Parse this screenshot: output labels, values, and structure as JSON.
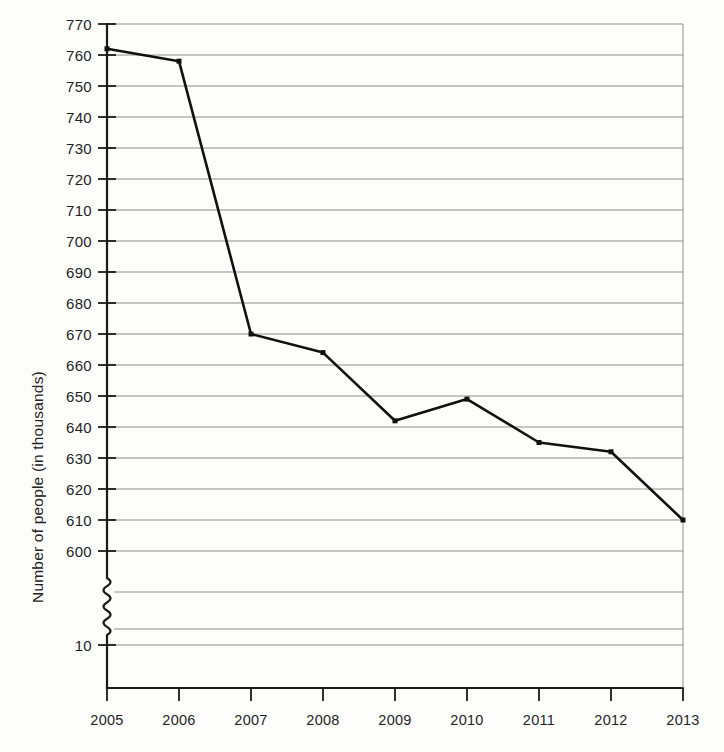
{
  "chart_data": {
    "type": "line",
    "title": "",
    "subtitle": "",
    "xlabel": "",
    "ylabel": "Number of people (in thousands)",
    "categories": [
      "2005",
      "2006",
      "2007",
      "2008",
      "2009",
      "2010",
      "2011",
      "2012",
      "2013"
    ],
    "x": [
      2005,
      2006,
      2007,
      2008,
      2009,
      2010,
      2011,
      2012,
      2013
    ],
    "values": [
      762,
      758,
      670,
      664,
      642,
      649,
      635,
      632,
      610
    ],
    "series": [
      {
        "name": "Number of people",
        "values": [
          762,
          758,
          670,
          664,
          642,
          649,
          635,
          632,
          610
        ]
      }
    ],
    "ylim": [
      600,
      770
    ],
    "ytick_labels": [
      "770",
      "760",
      "750",
      "740",
      "730",
      "720",
      "710",
      "700",
      "690",
      "680",
      "670",
      "660",
      "650",
      "640",
      "630",
      "620",
      "610",
      "600",
      "10"
    ],
    "ytick_values": [
      770,
      760,
      750,
      740,
      730,
      720,
      710,
      700,
      690,
      680,
      670,
      660,
      650,
      640,
      630,
      620,
      610,
      600,
      10
    ],
    "xtick_labels": [
      "2005",
      "2006",
      "2007",
      "2008",
      "2009",
      "2010",
      "2011",
      "2012",
      "2013"
    ],
    "grid": true,
    "grid_axis": "y",
    "legend": false,
    "legend_position": "none",
    "axis_break": true,
    "axis_break_note": "Y axis broken between 600 and 10",
    "marker": "square",
    "line_color": "#111111",
    "grid_color": "#8e8e8e",
    "background_color": "#fdfdfb",
    "annotations": []
  },
  "geometry": {
    "plot_left": 107,
    "plot_right": 683,
    "top_gridline_y": 24,
    "gridline_step_px": 31,
    "break_top_y": 578,
    "break_bottom_y": 635,
    "bottom_gridline_y": 645,
    "axis_bottom_y": 688
  }
}
